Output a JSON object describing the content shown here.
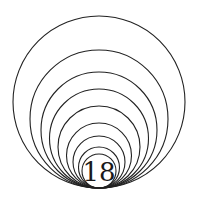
{
  "diagram": {
    "label": "18",
    "stroke_color": "#222222",
    "background": "#ffffff",
    "tangent_point": {
      "x": 99,
      "y": 188
    },
    "circle_radii": [
      86,
      69,
      58,
      49.5,
      41,
      32.5,
      26,
      20.5,
      17
    ]
  }
}
